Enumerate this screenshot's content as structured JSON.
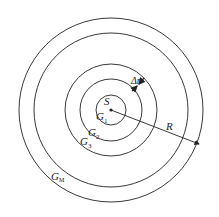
{
  "diagram": {
    "center_label": "S",
    "rings": [
      {
        "name": "G",
        "sub": "1"
      },
      {
        "name": "G",
        "sub": "2"
      },
      {
        "name": "G",
        "sub": "3"
      },
      {
        "name": "G",
        "sub": "M"
      }
    ],
    "ring_count_drawn": 5,
    "dimension_labels": {
      "ring_width": "Δr",
      "radius": "R"
    },
    "colors": {
      "stroke": "#222222",
      "background": "#ffffff"
    }
  }
}
